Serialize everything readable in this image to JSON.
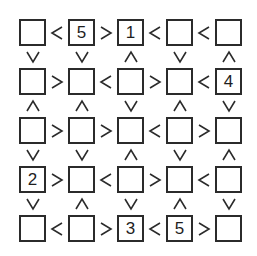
{
  "puzzle": {
    "type": "futoshiki",
    "size": 5,
    "line_color": "#2b2b2b",
    "grid": [
      [
        "",
        "5",
        "1",
        "",
        ""
      ],
      [
        "",
        "",
        "",
        "",
        "4"
      ],
      [
        "",
        "",
        "",
        "",
        ""
      ],
      [
        "2",
        "",
        "",
        "",
        ""
      ],
      [
        "",
        "",
        "3",
        "5",
        ""
      ]
    ],
    "horizontal_signs": [
      [
        "<",
        ">",
        "<",
        "<"
      ],
      [
        ">",
        "<",
        ">",
        "<"
      ],
      [
        ">",
        ">",
        "<",
        ">"
      ],
      [
        ">",
        "<",
        ">",
        "<"
      ],
      [
        "<",
        ">",
        "<",
        ">"
      ]
    ],
    "vertical_signs": [
      [
        "v",
        "v",
        "^",
        "v",
        "^"
      ],
      [
        "^",
        "^",
        "v",
        "^",
        "v"
      ],
      [
        "v",
        "v",
        "^",
        "v",
        "^"
      ],
      [
        "v",
        "^",
        "v",
        "^",
        "v"
      ]
    ]
  }
}
